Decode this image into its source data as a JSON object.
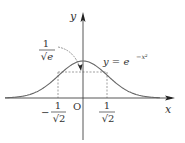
{
  "figure": {
    "equation": {
      "lhs": "y = e",
      "exponent": "−x²"
    },
    "axes": {
      "x_label": "x",
      "y_label": "y",
      "origin_label": "O"
    },
    "annotation": {
      "numerator": "1",
      "denominator": "√e"
    },
    "ticks": {
      "neg": {
        "sign": "−",
        "numerator": "1",
        "denominator": "√2"
      },
      "pos": {
        "numerator": "1",
        "denominator": "√2"
      }
    },
    "colors": {
      "curve": "#666666",
      "axis": "#444444",
      "dashed": "#777777"
    }
  }
}
